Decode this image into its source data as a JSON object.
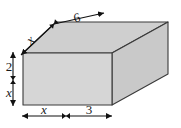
{
  "figure": {
    "shape": "rectangular-prism",
    "colors": {
      "front_face": "#d6d6d6",
      "top_face": "#cfcfcf",
      "right_face": "#c9c9c9",
      "outline": "#3a3a3a",
      "dimension_line": "#111111",
      "background": "#ffffff"
    },
    "dimensions": {
      "depth_top": {
        "position": "top-diagonal",
        "segments": [
          {
            "label": "x",
            "style": "italic"
          },
          {
            "label": "6",
            "style": "roman"
          }
        ]
      },
      "height_left": {
        "position": "left-vertical",
        "segments": [
          {
            "label": "2",
            "style": "roman"
          },
          {
            "label": "x",
            "style": "italic"
          }
        ]
      },
      "width_bottom": {
        "position": "bottom-horizontal",
        "segments": [
          {
            "label": "x",
            "style": "italic"
          },
          {
            "label": "3",
            "style": "roman"
          }
        ]
      }
    }
  }
}
